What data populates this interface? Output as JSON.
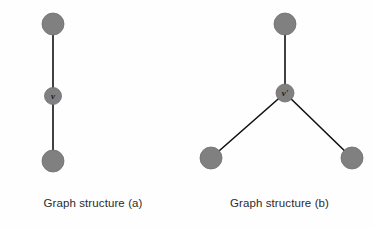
{
  "figure": {
    "width": 373,
    "height": 228,
    "background_color": "#fefefe",
    "node_color": "#808080",
    "node_stroke_color": "#6e6e6e",
    "edge_color": "#111111",
    "label_color": "#1a1a1a",
    "caption_color": "#2b2b2b"
  },
  "panels": [
    {
      "id": "a",
      "caption": "Graph structure (a)",
      "nodes": [
        {
          "id": "a-top",
          "label": "",
          "cx": 53,
          "cy": 24,
          "r": 11
        },
        {
          "id": "a-center",
          "label": "v",
          "cx": 53,
          "cy": 96,
          "r": 8.5
        },
        {
          "id": "a-bottom",
          "label": "",
          "cx": 53,
          "cy": 161,
          "r": 11
        }
      ],
      "edges": [
        {
          "from": "a-top",
          "to": "a-center",
          "x1": 53,
          "y1": 24,
          "x2": 53,
          "y2": 96
        },
        {
          "from": "a-center",
          "to": "a-bottom",
          "x1": 53,
          "y1": 96,
          "x2": 53,
          "y2": 161
        }
      ]
    },
    {
      "id": "b",
      "caption": "Graph structure (b)",
      "nodes": [
        {
          "id": "b-top",
          "label": "",
          "cx": 99,
          "cy": 24,
          "r": 11
        },
        {
          "id": "b-center",
          "label": "v'",
          "cx": 99,
          "cy": 93,
          "r": 9
        },
        {
          "id": "b-bottomleft",
          "label": "",
          "cx": 25,
          "cy": 158,
          "r": 11
        },
        {
          "id": "b-bottomright",
          "label": "",
          "cx": 166,
          "cy": 158,
          "r": 11
        }
      ],
      "edges": [
        {
          "from": "b-top",
          "to": "b-center",
          "x1": 99,
          "y1": 24,
          "x2": 99,
          "y2": 93
        },
        {
          "from": "b-center",
          "to": "b-bottomleft",
          "x1": 99,
          "y1": 93,
          "x2": 25,
          "y2": 158
        },
        {
          "from": "b-center",
          "to": "b-bottomright",
          "x1": 99,
          "y1": 93,
          "x2": 166,
          "y2": 158
        }
      ]
    }
  ]
}
